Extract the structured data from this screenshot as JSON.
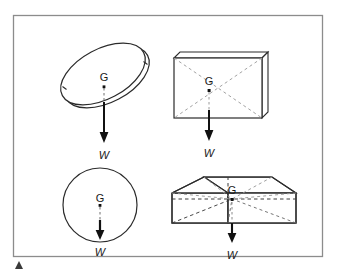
{
  "figure": {
    "name": "centre-of-gravity-diagram",
    "background_color": "#ffffff",
    "frame": {
      "name": "diagram-border",
      "x": 13,
      "y": 15,
      "width": 310,
      "height": 242,
      "stroke_color": "#8c8c8c",
      "fill_color": "#ffffff"
    },
    "marker": {
      "name": "corner-triangle-marker",
      "color": "#3a3a3a",
      "x": 16,
      "y": 261
    },
    "stroke_colors": {
      "outline": "#2b2b2b",
      "hidden_dashed": "#9a9a9a",
      "hidden_dashed_dark": "#3c3c3c",
      "arrow": "#111111",
      "shade": "#c9c9c9",
      "centroid_dot": "#111111"
    },
    "labels": {
      "centre_of_gravity": "G",
      "weight": "W"
    },
    "objects": [
      {
        "name": "tilted-disc",
        "shape": "disc",
        "label_g": "G",
        "label_w": "W",
        "g_point": {
          "x": 104,
          "y": 84
        },
        "arrow_tip": {
          "x": 104,
          "y": 143
        }
      },
      {
        "name": "thin-rectangular-plate",
        "shape": "plate",
        "label_g": "G",
        "label_w": "W",
        "g_point": {
          "x": 209,
          "y": 89
        },
        "arrow_tip": {
          "x": 209,
          "y": 141
        }
      },
      {
        "name": "sphere",
        "shape": "sphere",
        "label_g": "G",
        "label_w": "W",
        "g_point": {
          "x": 100,
          "y": 205
        },
        "arrow_tip": {
          "x": 100,
          "y": 240
        }
      },
      {
        "name": "rectangular-box",
        "shape": "cuboid",
        "label_g": "G",
        "label_w": "W",
        "g_point": {
          "x": 232,
          "y": 199
        },
        "arrow_tip": {
          "x": 232,
          "y": 243
        }
      }
    ]
  }
}
